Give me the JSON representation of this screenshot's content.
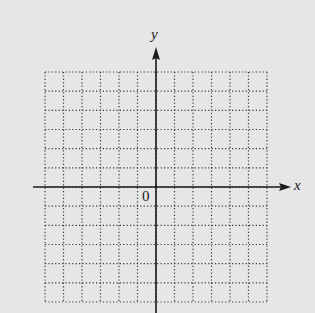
{
  "diagram": {
    "type": "coordinate-grid",
    "x_axis_label": "x",
    "y_axis_label": "y",
    "origin_label": "0",
    "grid": {
      "columns": 12,
      "rows": 12,
      "columns_left_of_y_axis": 6,
      "rows_above_x_axis": 6,
      "line_style": "dotted"
    },
    "colors": {
      "background": "#e6e6e6",
      "axis": "#1a1a1a",
      "grid": "#3a3a3a"
    }
  }
}
